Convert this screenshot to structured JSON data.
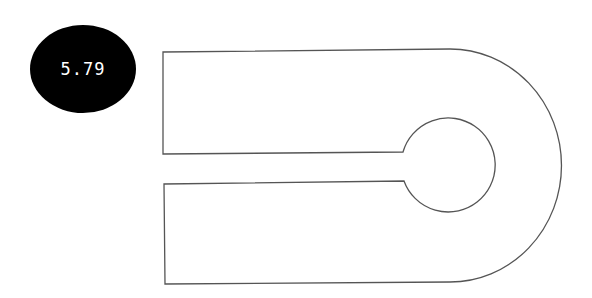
{
  "badge": {
    "value": "5.79",
    "background": "#000000",
    "text_color": "#ffffff"
  },
  "shape": {
    "description": "Outline of a U-shaped part with a slot leading to a circular hole",
    "stroke": "#555555",
    "fill": "#ffffff",
    "path": "M163,52 L450,49 A111,116 0 0 1 450,282 L165,284 L164,184 L404,181 A47,47 0 1 0 403,152 L163,154 Z"
  }
}
